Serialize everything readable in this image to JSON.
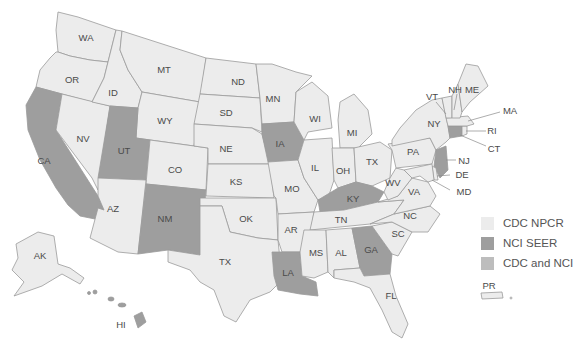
{
  "colors": {
    "cdc_npcr": "#ececec",
    "nci_seer": "#9e9e9e",
    "cdc_and_nci": "#bdbdbd",
    "border": "#9a9a9a",
    "label": "#4a4a4a"
  },
  "legend": {
    "items": [
      {
        "label": "CDC NPCR",
        "category": "cdc_npcr"
      },
      {
        "label": "NCI SEER",
        "category": "nci_seer"
      },
      {
        "label": "CDC and NCI",
        "category": "cdc_and_nci"
      }
    ]
  },
  "states": {
    "WA": {
      "label": "WA",
      "category": "cdc_npcr"
    },
    "OR": {
      "label": "OR",
      "category": "cdc_npcr"
    },
    "CA": {
      "label": "CA",
      "category": "nci_seer"
    },
    "NV": {
      "label": "NV",
      "category": "cdc_npcr"
    },
    "ID": {
      "label": "ID",
      "category": "cdc_npcr"
    },
    "MT": {
      "label": "MT",
      "category": "cdc_npcr"
    },
    "WY": {
      "label": "WY",
      "category": "cdc_npcr"
    },
    "UT": {
      "label": "UT",
      "category": "nci_seer"
    },
    "CO": {
      "label": "CO",
      "category": "cdc_npcr"
    },
    "AZ": {
      "label": "AZ",
      "category": "cdc_npcr"
    },
    "NM": {
      "label": "NM",
      "category": "nci_seer"
    },
    "ND": {
      "label": "ND",
      "category": "cdc_npcr"
    },
    "SD": {
      "label": "SD",
      "category": "cdc_npcr"
    },
    "NE": {
      "label": "NE",
      "category": "cdc_npcr"
    },
    "KS": {
      "label": "KS",
      "category": "cdc_npcr"
    },
    "OK": {
      "label": "OK",
      "category": "cdc_npcr"
    },
    "TX": {
      "label": "TX",
      "category": "cdc_npcr"
    },
    "MN": {
      "label": "MN",
      "category": "cdc_npcr"
    },
    "IA": {
      "label": "IA",
      "category": "nci_seer"
    },
    "MO": {
      "label": "MO",
      "category": "cdc_npcr"
    },
    "AR": {
      "label": "AR",
      "category": "cdc_npcr"
    },
    "LA": {
      "label": "LA",
      "category": "nci_seer"
    },
    "WI": {
      "label": "WI",
      "category": "cdc_npcr"
    },
    "IL": {
      "label": "IL",
      "category": "cdc_npcr"
    },
    "MI": {
      "label": "MI",
      "category": "cdc_npcr"
    },
    "IN": {
      "label": "OH",
      "category": "cdc_npcr"
    },
    "OH": {
      "label": "TX",
      "category": "cdc_npcr"
    },
    "KY": {
      "label": "KY",
      "category": "nci_seer"
    },
    "TN": {
      "label": "TN",
      "category": "cdc_npcr"
    },
    "MS": {
      "label": "MS",
      "category": "cdc_npcr"
    },
    "AL": {
      "label": "AL",
      "category": "cdc_npcr"
    },
    "GA": {
      "label": "GA",
      "category": "nci_seer"
    },
    "FL": {
      "label": "FL",
      "category": "cdc_npcr"
    },
    "SC": {
      "label": "SC",
      "category": "cdc_npcr"
    },
    "NC": {
      "label": "NC",
      "category": "cdc_npcr"
    },
    "VA": {
      "label": "VA",
      "category": "cdc_npcr"
    },
    "WV": {
      "label": "WV",
      "category": "cdc_npcr"
    },
    "PA": {
      "label": "PA",
      "category": "cdc_npcr"
    },
    "NY": {
      "label": "NY",
      "category": "cdc_npcr"
    },
    "NJ": {
      "label": "NJ",
      "category": "nci_seer"
    },
    "DE": {
      "label": "DE",
      "category": "cdc_npcr"
    },
    "MD": {
      "label": "MD",
      "category": "cdc_npcr"
    },
    "CT": {
      "label": "CT",
      "category": "nci_seer"
    },
    "RI": {
      "label": "RI",
      "category": "cdc_npcr"
    },
    "MA": {
      "label": "MA",
      "category": "cdc_npcr"
    },
    "VT": {
      "label": "VT",
      "category": "cdc_npcr"
    },
    "NH": {
      "label": "NH",
      "category": "cdc_npcr"
    },
    "ME": {
      "label": "ME",
      "category": "cdc_npcr"
    },
    "AK": {
      "label": "AK",
      "category": "cdc_npcr"
    },
    "HI": {
      "label": "HI",
      "category": "nci_seer"
    },
    "PR": {
      "label": "PR",
      "category": "cdc_npcr"
    }
  }
}
